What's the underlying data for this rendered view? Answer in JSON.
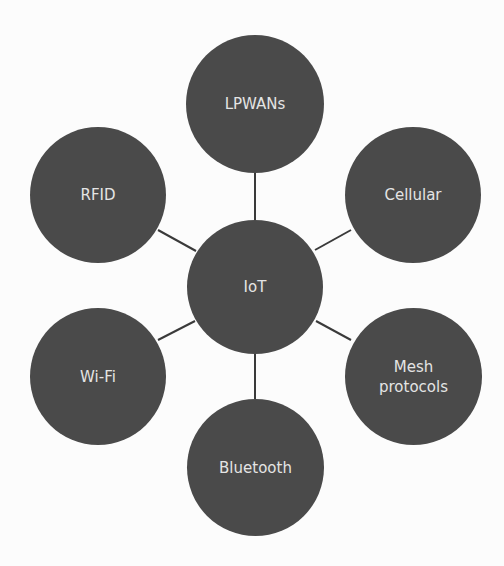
{
  "diagram": {
    "type": "hub-and-spoke",
    "colors": {
      "node_fill": "#4a4a4a",
      "node_text": "#e4e4e4",
      "link": "#3a3a3a",
      "background": "#fcfcfc"
    },
    "center": {
      "label": "IoT"
    },
    "nodes": [
      {
        "id": "lpwans",
        "label": "LPWANs"
      },
      {
        "id": "cellular",
        "label": "Cellular"
      },
      {
        "id": "mesh",
        "label_line1": "Mesh",
        "label_line2": "protocols"
      },
      {
        "id": "bluetooth",
        "label": "Bluetooth"
      },
      {
        "id": "wifi",
        "label": "Wi-Fi"
      },
      {
        "id": "rfid",
        "label": "RFID"
      }
    ]
  }
}
